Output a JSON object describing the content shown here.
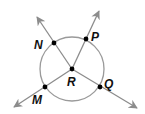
{
  "diagram": {
    "type": "circle-with-rays",
    "colors": {
      "circle": "#9a9a9a",
      "ray": "#8c8c8c",
      "arrowhead": "#8c8c8c",
      "point": "#000000",
      "label": "#111111",
      "background": "#ffffff"
    },
    "center": {
      "label": "R",
      "x": 72,
      "y": 69
    },
    "circle": {
      "cx": 72,
      "cy": 69,
      "r": 32
    },
    "points": [
      {
        "label": "N",
        "x": 54,
        "y": 43,
        "label_x": 34,
        "label_y": 49
      },
      {
        "label": "P",
        "x": 86,
        "y": 39,
        "label_x": 91,
        "label_y": 41
      },
      {
        "label": "Q",
        "x": 100,
        "y": 87,
        "label_x": 104,
        "label_y": 88
      },
      {
        "label": "M",
        "x": 45,
        "y": 87,
        "label_x": 32,
        "label_y": 104
      }
    ],
    "rays": [
      {
        "from": "R",
        "through": "N",
        "tip_x": 37,
        "tip_y": 17
      },
      {
        "from": "R",
        "through": "P",
        "tip_x": 99,
        "tip_y": 11
      },
      {
        "from": "R",
        "through": "Q",
        "tip_x": 137,
        "tip_y": 108
      },
      {
        "from": "R",
        "through": "M",
        "tip_x": 14,
        "tip_y": 107
      }
    ],
    "center_label_pos": {
      "x": 67,
      "y": 86
    }
  }
}
